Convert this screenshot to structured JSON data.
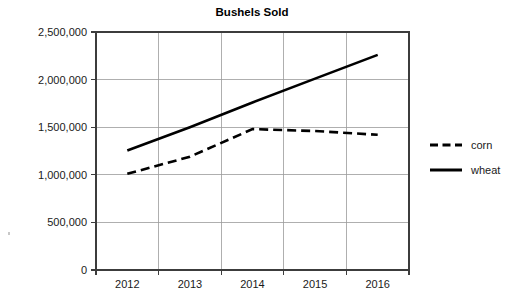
{
  "chart_data": {
    "type": "line",
    "title": "Bushels Sold",
    "xlabel": "",
    "ylabel": "",
    "categories": [
      "2012",
      "2013",
      "2014",
      "2015",
      "2016"
    ],
    "series": [
      {
        "name": "corn",
        "style": "dashed",
        "color": "#000000",
        "values": [
          1010000,
          1190000,
          1480000,
          1460000,
          1420000
        ]
      },
      {
        "name": "wheat",
        "style": "solid",
        "color": "#000000",
        "values": [
          1255000,
          1500000,
          1760000,
          2010000,
          2260000
        ]
      }
    ],
    "ylim": [
      0,
      2500000
    ],
    "ystep": 500000,
    "ytick_labels": [
      "0",
      "500,000",
      "1,000,000",
      "1,500,000",
      "2,000,000",
      "2,500,000"
    ],
    "ytick_values": [
      0,
      500000,
      1000000,
      1500000,
      2000000,
      2500000
    ],
    "grid": true,
    "grid_axis": "both",
    "legend_position": "right",
    "legend_entries": [
      {
        "label": "corn",
        "style": "dashed"
      },
      {
        "label": "wheat",
        "style": "solid"
      }
    ]
  },
  "colors": {
    "background": "#ffffff",
    "ink": "#000000",
    "gridline": "#9b9b9b",
    "axis": "#3c3c3c"
  }
}
